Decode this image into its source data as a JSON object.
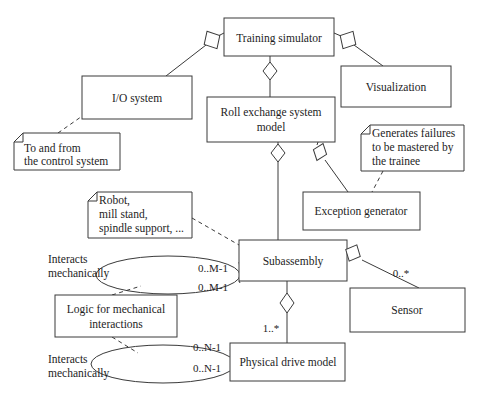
{
  "diagram": {
    "type": "uml-class-diagram",
    "background": "#ffffff",
    "line_color": "#3a3a3a",
    "text_color": "#1d1d1d",
    "classes": [
      {
        "id": "training_simulator",
        "label": "Training simulator",
        "x": 224,
        "y": 18,
        "w": 110,
        "h": 38
      },
      {
        "id": "io_system",
        "label": "I/O system",
        "x": 82,
        "y": 76,
        "w": 110,
        "h": 43
      },
      {
        "id": "visualization",
        "label": "Visualization",
        "x": 341,
        "y": 66,
        "w": 110,
        "h": 41
      },
      {
        "id": "roll_exchange",
        "label": "Roll exchange system\nmodel",
        "line1": "Roll exchange system",
        "line2": "model",
        "x": 207,
        "y": 97,
        "w": 128,
        "h": 45
      },
      {
        "id": "exception_generator",
        "label": "Exception generator",
        "x": 303,
        "y": 192,
        "w": 117,
        "h": 38
      },
      {
        "id": "subassembly",
        "label": "Subassembly",
        "x": 239,
        "y": 240,
        "w": 108,
        "h": 41
      },
      {
        "id": "sensor",
        "label": "Sensor",
        "x": 350,
        "y": 288,
        "w": 115,
        "h": 44
      },
      {
        "id": "logic_mechanical",
        "label": "Logic for mechanical\ninteractions",
        "line1": "Logic for mechanical",
        "line2": "interactions",
        "x": 55,
        "y": 295,
        "w": 122,
        "h": 42
      },
      {
        "id": "physical_drive",
        "label": "Physical drive model",
        "x": 230,
        "y": 343,
        "w": 115,
        "h": 38
      }
    ],
    "notes": [
      {
        "id": "note_control_system",
        "lines": [
          "To and from",
          "the control system"
        ],
        "x": 14,
        "y": 133,
        "w": 106,
        "h": 37
      },
      {
        "id": "note_generates_failures",
        "lines": [
          "Generates failures",
          "to be mastered by",
          "the trainee"
        ],
        "x": 361,
        "y": 125,
        "w": 103,
        "h": 46
      },
      {
        "id": "note_robot_parts",
        "lines": [
          "Robot,",
          "mill stand,",
          "spindle support, ..."
        ],
        "x": 88,
        "y": 192,
        "w": 104,
        "h": 46
      }
    ],
    "associations": [
      {
        "id": "assoc_interacts_upper",
        "lines": [
          "Interacts",
          "mechanically"
        ],
        "x": 48,
        "y": 252
      },
      {
        "id": "assoc_interacts_lower",
        "lines": [
          "Interacts",
          "mechanically"
        ],
        "x": 48,
        "y": 354
      }
    ],
    "multiplicities": [
      {
        "id": "mult_m1_top",
        "text": "0..M-1",
        "x": 213,
        "y": 272
      },
      {
        "id": "mult_m1_bottom",
        "text": "0..M-1",
        "x": 213,
        "y": 291
      },
      {
        "id": "mult_n1_top",
        "text": "0..N-1",
        "x": 207,
        "y": 351
      },
      {
        "id": "mult_n1_bottom",
        "text": "0..N-1",
        "x": 207,
        "y": 372
      },
      {
        "id": "mult_one_star",
        "text": "1..*",
        "x": 271,
        "y": 332
      },
      {
        "id": "mult_zero_star",
        "text": "0..*",
        "x": 401,
        "y": 277
      }
    ],
    "aggregation_diamonds": [
      {
        "id": "diamond_ts_io",
        "cx": 212,
        "cy": 40,
        "rotation": -30
      },
      {
        "id": "diamond_ts_vis",
        "cx": 348,
        "cy": 40,
        "rotation": 30
      },
      {
        "id": "diamond_ts_roll",
        "cx": 270,
        "cy": 71,
        "rotation": 0
      },
      {
        "id": "diamond_roll_sub",
        "cx": 278,
        "cy": 153,
        "rotation": 0
      },
      {
        "id": "diamond_roll_exc",
        "cx": 320,
        "cy": 152,
        "rotation": 20
      },
      {
        "id": "diamond_sub_sensor",
        "cx": 353,
        "cy": 253,
        "rotation": 25
      },
      {
        "id": "diamond_sub_drive",
        "cx": 287,
        "cy": 303,
        "rotation": 0
      }
    ],
    "ellipses": [
      {
        "id": "ellipse_upper",
        "cx": 168,
        "cy": 275,
        "rx": 72,
        "ry": 19
      },
      {
        "id": "ellipse_lower",
        "cx": 163,
        "cy": 364,
        "rx": 72,
        "ry": 19
      }
    ]
  }
}
